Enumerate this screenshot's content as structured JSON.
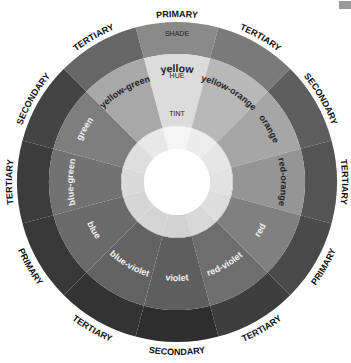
{
  "wheel": {
    "center": [
      177,
      182
    ],
    "radii": {
      "outer": 160,
      "shade_inner": 128,
      "hue_inner": 86,
      "tint_inner": 56,
      "inner_inner": 33
    },
    "ring_labels": {
      "shade": "SHADE",
      "hue": "HUE",
      "tint": "TINT"
    },
    "segments": [
      {
        "name": "yellow",
        "category": "PRIMARY",
        "shade": "#8a8a8a",
        "hue": "#dcdcdc",
        "tint": "#ededed",
        "inner": "#f5f5f5",
        "label_color": "#222222"
      },
      {
        "name": "yellow-orange",
        "category": "TERTIARY",
        "shade": "#7a7a7a",
        "hue": "#b8b8b8",
        "tint": "#dedede",
        "inner": "#ececec",
        "label_color": "#222222"
      },
      {
        "name": "orange",
        "category": "SECONDARY",
        "shade": "#5e5e5e",
        "hue": "#a6a6a6",
        "tint": "#d6d6d6",
        "inner": "#e6e6e6",
        "label_color": "#222222"
      },
      {
        "name": "red-orange",
        "category": "TERTIARY",
        "shade": "#545454",
        "hue": "#959595",
        "tint": "#cfcfcf",
        "inner": "#e2e2e2",
        "label_color": "#222222"
      },
      {
        "name": "red",
        "category": "PRIMARY",
        "shade": "#4a4a4a",
        "hue": "#808080",
        "tint": "#c6c6c6",
        "inner": "#dddddd",
        "label_color": "#f2f2f2"
      },
      {
        "name": "red-violet",
        "category": "TERTIARY",
        "shade": "#3e3e3e",
        "hue": "#6e6e6e",
        "tint": "#bdbdbd",
        "inner": "#d8d8d8",
        "label_color": "#f2f2f2"
      },
      {
        "name": "violet",
        "category": "SECONDARY",
        "shade": "#2e2e2e",
        "hue": "#5e5e5e",
        "tint": "#b2b2b2",
        "inner": "#d2d2d2",
        "label_color": "#f2f2f2"
      },
      {
        "name": "blue-violet",
        "category": "TERTIARY",
        "shade": "#333333",
        "hue": "#626262",
        "tint": "#b6b6b6",
        "inner": "#d4d4d4",
        "label_color": "#f2f2f2"
      },
      {
        "name": "blue",
        "category": "PRIMARY",
        "shade": "#383838",
        "hue": "#6a6a6a",
        "tint": "#bababa",
        "inner": "#d6d6d6",
        "label_color": "#f2f2f2"
      },
      {
        "name": "blue-green",
        "category": "TERTIARY",
        "shade": "#3c3c3c",
        "hue": "#727272",
        "tint": "#c0c0c0",
        "inner": "#dadada",
        "label_color": "#f2f2f2"
      },
      {
        "name": "green",
        "category": "SECONDARY",
        "shade": "#444444",
        "hue": "#7e7e7e",
        "tint": "#c8c8c8",
        "inner": "#dedede",
        "label_color": "#f2f2f2"
      },
      {
        "name": "yellow-green",
        "category": "TERTIARY",
        "shade": "#666666",
        "hue": "#a8a8a8",
        "tint": "#d8d8d8",
        "inner": "#e8e8e8",
        "label_color": "#222222"
      }
    ],
    "center_color": "#ffffff",
    "outer_label_color": "#111111"
  }
}
